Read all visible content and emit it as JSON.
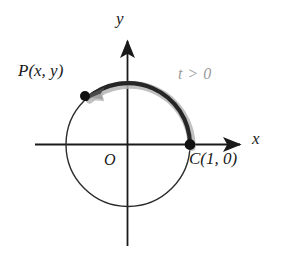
{
  "figure": {
    "background_color": "#ffffff",
    "width": 284,
    "height": 264
  },
  "colors": {
    "axis": "#1a1a1a",
    "circle": "#2b2b2b",
    "arc_highlight": "#262626",
    "arc_glow": "#b5b5b5",
    "point_fill": "#111111",
    "label_text": "#1a1a1a",
    "param_text": "#9a9a9a"
  },
  "axes": {
    "x_label": "x",
    "y_label": "y",
    "origin_label": "O",
    "x_axis": {
      "y": 144.5,
      "x_start": 35,
      "x_end": 243,
      "arrow": "right"
    },
    "y_axis": {
      "x": 127.5,
      "y_start": 246,
      "y_end": 38,
      "arrow": "up"
    }
  },
  "circle": {
    "center_x": 128,
    "center_y": 144.5,
    "radius": 62,
    "stroke_width": 1.4
  },
  "points": [
    {
      "name": "point-p",
      "label": "P(x, y)",
      "cx": 85,
      "cy": 96,
      "r": 5,
      "label_position": "upper-left"
    },
    {
      "name": "point-c",
      "label": "C(1, 0)",
      "cx": 190,
      "cy": 144.5,
      "r": 5.4,
      "label_position": "lower-right"
    }
  ],
  "arc": {
    "name": "arc-from-c-to-p",
    "parameter_label": "t > 0",
    "direction": "counterclockwise",
    "start_point": "C(1, 0)",
    "end_point": "P(x, y)",
    "start_angle_deg": 0,
    "end_angle_deg": 129,
    "stroke_width": 4.2,
    "glow_stroke_width": 8,
    "arrowhead": "at-end-near-P"
  }
}
